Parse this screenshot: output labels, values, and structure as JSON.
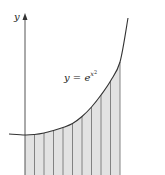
{
  "figure": {
    "axis_label_y": "y",
    "curve_label": {
      "base": "y = e",
      "exponent_var": "x",
      "exponent_power": "2"
    },
    "function": "e^(x^2)",
    "strip_count": 10,
    "colors": {
      "curve": "#333333",
      "axis": "#555555",
      "strip_fill": "#e2e2e2",
      "strip_line": "#777777",
      "background": "#ffffff"
    },
    "strip_boundaries_px": [
      25,
      34.5,
      44,
      53.5,
      63,
      72.5,
      82,
      91.5,
      101,
      110.5,
      120
    ],
    "curve_points_px": [
      [
        9,
        134
      ],
      [
        25,
        135
      ],
      [
        34.5,
        134.5
      ],
      [
        44,
        133
      ],
      [
        53.5,
        130.5
      ],
      [
        63,
        127.5
      ],
      [
        72.5,
        123.5
      ],
      [
        82,
        116.5
      ],
      [
        91.5,
        107
      ],
      [
        101,
        95
      ],
      [
        110.5,
        81
      ],
      [
        120,
        62
      ],
      [
        128,
        18
      ]
    ]
  }
}
